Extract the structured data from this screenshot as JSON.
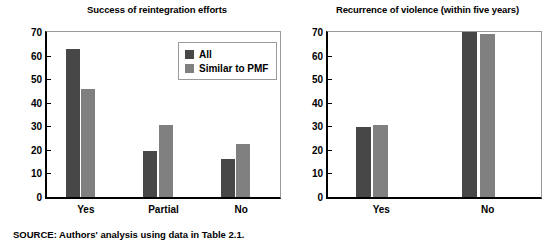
{
  "figure": {
    "source_note": "SOURCE: Authors' analysis using data in Table 2.1."
  },
  "legend": {
    "items": [
      {
        "label": "All",
        "color": "#474747",
        "swatch_name": "legend-swatch-all"
      },
      {
        "label": "Similar to PMF",
        "color": "#808080",
        "swatch_name": "legend-swatch-similar-to-pmf"
      }
    ]
  },
  "chart_data": [
    {
      "type": "bar",
      "title": "Success of reintegration efforts",
      "xlabel": "",
      "ylabel": "Percentage of cases",
      "ylim": [
        0,
        70
      ],
      "yticks": [
        0,
        10,
        20,
        30,
        40,
        50,
        60,
        70
      ],
      "ytick_labels": [
        "0",
        "10",
        "20",
        "30",
        "40",
        "50",
        "60",
        "70"
      ],
      "grid": false,
      "legend_position": "top-right inside plot",
      "categories": [
        "Yes",
        "Partial",
        "No"
      ],
      "series": [
        {
          "name": "All",
          "color": "#474747",
          "values": [
            63,
            19.5,
            16
          ]
        },
        {
          "name": "Similar to PMF",
          "color": "#808080",
          "values": [
            46,
            30.5,
            22.5
          ]
        }
      ]
    },
    {
      "type": "bar",
      "title": "Recurrence of violence (within five years)",
      "xlabel": "",
      "ylabel": "",
      "ylim": [
        0,
        70
      ],
      "yticks": [
        0,
        10,
        20,
        30,
        40,
        50,
        60,
        70
      ],
      "ytick_labels": [
        "0",
        "10",
        "20",
        "30",
        "40",
        "50",
        "60",
        "70"
      ],
      "grid": false,
      "legend_position": "none",
      "categories": [
        "Yes",
        "No"
      ],
      "series": [
        {
          "name": "All",
          "color": "#474747",
          "values": [
            29.5,
            70
          ]
        },
        {
          "name": "Similar to PMF",
          "color": "#808080",
          "values": [
            30.5,
            69
          ]
        }
      ]
    }
  ]
}
